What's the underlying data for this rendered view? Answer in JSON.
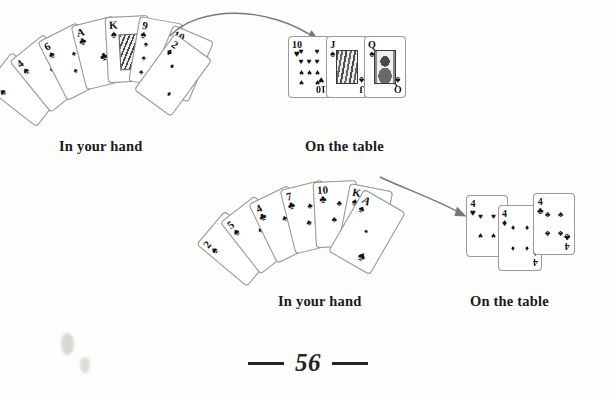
{
  "page": {
    "number": "56",
    "background_color": "#fdfdfc",
    "ink_color": "#1a1a1a"
  },
  "scenes": [
    {
      "id": "scene-top",
      "hand_caption": "In your hand",
      "table_caption": "On the table",
      "hand_cards": [
        {
          "rank": "2",
          "suit": "spades",
          "suit_glyph": "♠"
        },
        {
          "rank": "4",
          "suit": "spades",
          "suit_glyph": "♠"
        },
        {
          "rank": "6",
          "suit": "spades",
          "suit_glyph": "♠"
        },
        {
          "rank": "A",
          "suit": "clubs",
          "suit_glyph": "♣"
        },
        {
          "rank": "K",
          "suit": "spades",
          "suit_glyph": "♠"
        },
        {
          "rank": "9",
          "suit": "spades",
          "suit_glyph": "♠"
        },
        {
          "rank": "10",
          "suit": "spades",
          "suit_glyph": "♠"
        },
        {
          "rank": "2",
          "suit": "diamonds",
          "suit_glyph": "♦"
        }
      ],
      "table_cards": [
        {
          "rank": "10",
          "suit": "hearts",
          "suit_glyph": "♥"
        },
        {
          "rank": "J",
          "suit": "spades",
          "suit_glyph": "♠"
        },
        {
          "rank": "Q",
          "suit": "spades",
          "suit_glyph": "♠"
        }
      ],
      "arrow": "curved-arrow-hand-to-table"
    },
    {
      "id": "scene-bottom",
      "hand_caption": "In your hand",
      "table_caption": "On the table",
      "hand_cards": [
        {
          "rank": "2",
          "suit": "spades",
          "suit_glyph": "♠"
        },
        {
          "rank": "5",
          "suit": "spades",
          "suit_glyph": "♠"
        },
        {
          "rank": "4",
          "suit": "clubs",
          "suit_glyph": "♣"
        },
        {
          "rank": "7",
          "suit": "clubs",
          "suit_glyph": "♣"
        },
        {
          "rank": "10",
          "suit": "clubs",
          "suit_glyph": "♣"
        },
        {
          "rank": "K",
          "suit": "spades",
          "suit_glyph": "♠"
        },
        {
          "rank": "A",
          "suit": "spades",
          "suit_glyph": "♠"
        }
      ],
      "table_cards": [
        {
          "rank": "4",
          "suit": "hearts",
          "suit_glyph": "♥"
        },
        {
          "rank": "4",
          "suit": "diamonds",
          "suit_glyph": "♦"
        },
        {
          "rank": "4",
          "suit": "clubs",
          "suit_glyph": "♣"
        }
      ],
      "arrow": "curved-arrow-hand-to-table"
    }
  ]
}
